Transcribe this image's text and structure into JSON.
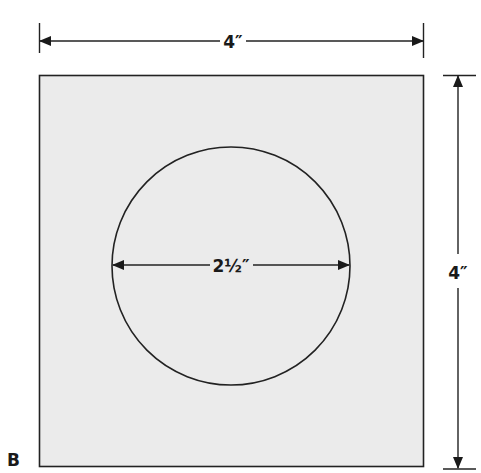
{
  "figure": {
    "label": "B",
    "square": {
      "width_label": "4″",
      "height_label": "4″",
      "fill": "#ebebeb",
      "stroke": "#222222"
    },
    "circle": {
      "diameter_label": "2½″",
      "stroke": "#222222"
    }
  }
}
